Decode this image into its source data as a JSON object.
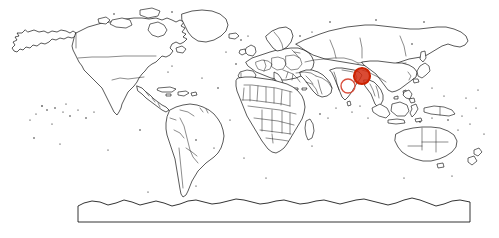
{
  "figure": {
    "type": "world-map",
    "projection": "equirectangular",
    "title": "",
    "background_color": "#ffffff",
    "coastline_color": "#000000",
    "border_color": "#1a1a1a",
    "width_px": 499,
    "height_px": 238
  },
  "markers": [
    {
      "id": "marker-india",
      "label": "",
      "style": "open-circle",
      "color": "#d94f3d",
      "fill": "none",
      "stroke_width": 1.4,
      "cx": 348,
      "cy": 86,
      "r": 7,
      "region": "India"
    },
    {
      "id": "marker-myanmar",
      "label": "",
      "style": "filled-circle",
      "color": "#cc2200",
      "fill": "#d42b10",
      "stroke_width": 2.2,
      "cx": 362,
      "cy": 76,
      "r": 8,
      "region": "Myanmar / Southeast Asia"
    }
  ],
  "antarctic_box": {
    "x": 78,
    "y": 206,
    "width": 392,
    "height": 16
  },
  "legend": {
    "visible": false,
    "entries": []
  },
  "axes": {
    "visible": false,
    "x_ticks": [],
    "y_ticks": []
  }
}
